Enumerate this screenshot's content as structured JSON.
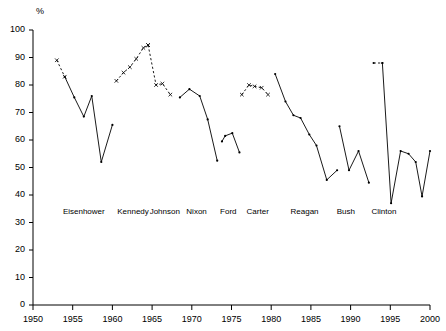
{
  "chart_data": {
    "type": "line",
    "title": "",
    "subtitle": "",
    "xlabel": "",
    "ylabel": "%",
    "unit_label": "%",
    "xlim": [
      1950,
      2000
    ],
    "ylim": [
      0,
      100
    ],
    "grid": false,
    "legend": "none",
    "x_ticks": [
      1950,
      1955,
      1960,
      1965,
      1970,
      1975,
      1980,
      1985,
      1990,
      1995,
      2000
    ],
    "y_ticks": [
      0,
      10,
      20,
      30,
      40,
      50,
      60,
      70,
      80,
      90,
      100
    ],
    "annotations": [
      {
        "text": "Eisenhower",
        "x": 1956.4,
        "y": 33
      },
      {
        "text": "Kennedy",
        "x": 1962.6,
        "y": 33
      },
      {
        "text": "Johnson",
        "x": 1966.6,
        "y": 33
      },
      {
        "text": "Nixon",
        "x": 1970.6,
        "y": 33
      },
      {
        "text": "Ford",
        "x": 1974.6,
        "y": 33
      },
      {
        "text": "Carter",
        "x": 1978.3,
        "y": 33
      },
      {
        "text": "Reagan",
        "x": 1984.2,
        "y": 33
      },
      {
        "text": "Bush",
        "x": 1989.4,
        "y": 33
      },
      {
        "text": "Clinton",
        "x": 1994.2,
        "y": 33
      }
    ],
    "series": [
      {
        "name": "Eisenhower",
        "style": "dashed",
        "marker": "x",
        "x": [
          1953.0,
          1954.0
        ],
        "values": [
          89,
          83
        ]
      },
      {
        "name": "Eisenhower",
        "style": "solid",
        "marker": "dot",
        "x": [
          1954.0,
          1955.2,
          1956.4,
          1957.4,
          1958.6,
          1960.0
        ],
        "values": [
          83,
          75.5,
          68.5,
          76,
          52,
          65.5
        ]
      },
      {
        "name": "Kennedy",
        "style": "dashed",
        "marker": "x",
        "x": [
          1960.5,
          1961.4,
          1962.2,
          1963.0,
          1963.9,
          1964.5
        ],
        "values": [
          81.5,
          84.5,
          86.5,
          89.5,
          93.5,
          94.5
        ]
      },
      {
        "name": "Johnson",
        "style": "dashed",
        "marker": "x",
        "x": [
          1964.5,
          1965.5,
          1966.3,
          1967.3
        ],
        "values": [
          94.5,
          80,
          80.5,
          76.5
        ]
      },
      {
        "name": "Nixon",
        "style": "solid",
        "marker": "dot",
        "x": [
          1968.5,
          1969.7,
          1971.0,
          1972.0,
          1973.2
        ],
        "values": [
          75.5,
          78.5,
          76,
          67.5,
          52.5
        ]
      },
      {
        "name": "Ford",
        "style": "solid",
        "marker": "dot",
        "x": [
          1973.8,
          1974.2,
          1975.1,
          1976.0
        ],
        "values": [
          59.5,
          61.5,
          62.5,
          55.5
        ]
      },
      {
        "name": "Carter",
        "style": "dashed",
        "marker": "x",
        "x": [
          1976.3,
          1977.2,
          1977.9,
          1978.8,
          1979.6
        ],
        "values": [
          76.5,
          80,
          79.5,
          79,
          76.5
        ]
      },
      {
        "name": "Reagan",
        "style": "solid",
        "marker": "dot",
        "x": [
          1980.5,
          1981.8,
          1982.8,
          1983.7,
          1984.8,
          1985.7,
          1987.0,
          1988.3
        ],
        "values": [
          84,
          74,
          69,
          68,
          62,
          58,
          45.5,
          49
        ]
      },
      {
        "name": "Bush",
        "style": "solid",
        "marker": "dot",
        "x": [
          1988.6,
          1989.8,
          1991.0,
          1992.3
        ],
        "values": [
          65,
          49,
          56,
          44.5
        ]
      },
      {
        "name": "Clinton",
        "style": "dashed",
        "marker": "dot",
        "x": [
          1992.9,
          1994.0
        ],
        "values": [
          88,
          88
        ]
      },
      {
        "name": "Clinton",
        "style": "solid",
        "marker": "dot",
        "x": [
          1994.0,
          1995.1,
          1996.3,
          1997.3,
          1998.2,
          1999.0,
          2000.0
        ],
        "values": [
          88,
          37,
          56,
          55,
          52,
          39.5,
          56
        ]
      }
    ]
  }
}
